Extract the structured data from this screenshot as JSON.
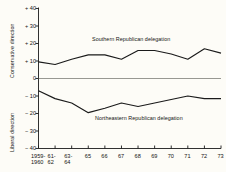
{
  "chart_data": {
    "type": "line",
    "title": "",
    "xlabel": "",
    "ylabel_top": "Conservative direction",
    "ylabel_bottom": "Liberal direction",
    "ylim": [
      -40,
      40
    ],
    "yticks": [
      "+ 40",
      "+ 30",
      "+ 20",
      "+ 10",
      "0",
      "− 10",
      "− 20",
      "− 30",
      "− 40"
    ],
    "ytick_values": [
      40,
      30,
      20,
      10,
      0,
      -10,
      -20,
      -30,
      -40
    ],
    "grid": false,
    "legend_position": "inline-annotation",
    "zero_line": true,
    "categories": [
      "1959-1960",
      "61-62",
      "63-64",
      "65",
      "66",
      "67",
      "68",
      "69",
      "70",
      "71",
      "72",
      "73"
    ],
    "xtick_labels": [
      {
        "line1": "1959-",
        "line2": "1960"
      },
      {
        "line1": "61-",
        "line2": "62"
      },
      {
        "line1": "63-",
        "line2": "64"
      },
      {
        "line1": "65",
        "line2": ""
      },
      {
        "line1": "66",
        "line2": ""
      },
      {
        "line1": "67",
        "line2": ""
      },
      {
        "line1": "68",
        "line2": ""
      },
      {
        "line1": "69",
        "line2": ""
      },
      {
        "line1": "70",
        "line2": ""
      },
      {
        "line1": "71",
        "line2": ""
      },
      {
        "line1": "72",
        "line2": ""
      },
      {
        "line1": "73",
        "line2": ""
      }
    ],
    "series": [
      {
        "name": "Southern Republican delegation",
        "color": "#1a1a1a",
        "values": [
          9.5,
          8.0,
          11.0,
          13.5,
          13.5,
          11.0,
          16.0,
          16.0,
          14.0,
          11.0,
          17.0,
          14.5
        ],
        "annotation": "Southern Republican delegation"
      },
      {
        "name": "Northeastern Republican delegation",
        "color": "#1a1a1a",
        "values": [
          -7.0,
          -11.5,
          -14.0,
          -19.5,
          -17.0,
          -14.0,
          -16.0,
          -14.0,
          -12.0,
          -10.0,
          -11.5,
          -11.5
        ],
        "annotation": "Northeastern Republican delegation"
      }
    ]
  },
  "colors": {
    "background": "#fdfcf7",
    "axis": "#1a1a1a",
    "zero_line": "#8c8c86",
    "line": "#1a1a1a"
  }
}
